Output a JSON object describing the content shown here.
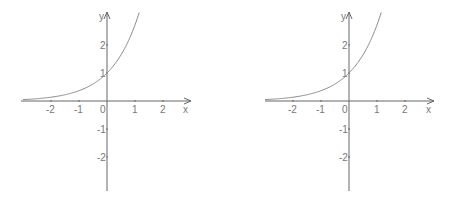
{
  "chart_data": [
    {
      "type": "line",
      "title": "",
      "function": "y = e^x",
      "xlabel": "x",
      "ylabel": "y",
      "x_ticks": [
        "-2",
        "-1",
        "0",
        "1",
        "2"
      ],
      "y_ticks": [
        "2",
        "1",
        "-1",
        "-2"
      ],
      "xlim": [
        -3.1,
        3.0
      ],
      "ylim": [
        -3.2,
        3.2
      ],
      "grid": false,
      "legend": null,
      "series": [
        {
          "name": "e^x",
          "x": [
            -3.0,
            -2.5,
            -2.0,
            -1.5,
            -1.0,
            -0.5,
            0.0,
            0.25,
            0.5,
            0.75,
            1.0,
            1.15
          ],
          "values": [
            0.05,
            0.08,
            0.14,
            0.22,
            0.37,
            0.61,
            1.0,
            1.28,
            1.65,
            2.12,
            2.72,
            3.16
          ]
        }
      ],
      "colors": {
        "axis": "#666666",
        "curve": "#8a8a8a",
        "label": "#777777"
      },
      "origin_px": [
        107,
        101
      ],
      "unit_px": 28,
      "axis_extent_px": {
        "x_left": 21,
        "x_right": 191,
        "y_top": 12,
        "y_bottom": 191
      }
    },
    {
      "type": "line",
      "title": "",
      "function": "y = e^x",
      "xlabel": "x",
      "ylabel": "y",
      "x_ticks": [
        "-2",
        "-1",
        "0",
        "1",
        "2"
      ],
      "y_ticks": [
        "2",
        "1",
        "-1",
        "-2"
      ],
      "xlim": [
        -3.1,
        3.0
      ],
      "ylim": [
        -3.2,
        3.2
      ],
      "grid": false,
      "legend": null,
      "series": [
        {
          "name": "e^x",
          "x": [
            -3.0,
            -2.5,
            -2.0,
            -1.5,
            -1.0,
            -0.5,
            0.0,
            0.25,
            0.5,
            0.75,
            1.0,
            1.15
          ],
          "values": [
            0.05,
            0.08,
            0.14,
            0.22,
            0.37,
            0.61,
            1.0,
            1.28,
            1.65,
            2.12,
            2.72,
            3.16
          ]
        }
      ],
      "colors": {
        "axis": "#666666",
        "curve": "#8a8a8a",
        "label": "#777777"
      },
      "origin_px": [
        349,
        101
      ],
      "unit_px": 28,
      "axis_extent_px": {
        "x_left": 265,
        "x_right": 434,
        "y_top": 12,
        "y_bottom": 191
      }
    }
  ]
}
